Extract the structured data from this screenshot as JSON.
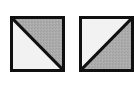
{
  "canvas": {
    "width": 134,
    "height": 86,
    "background_color": "#ffffff"
  },
  "figure": {
    "tile_count": 2,
    "border_color": "#101010",
    "border_width_px": 3,
    "light_fill_color": "#f2f2f2",
    "gray_fill_color": "#ababab",
    "gray_fill_texture": "dithered-speckle"
  },
  "tiles": [
    {
      "id": "tile-left",
      "label": "Square 1",
      "diagonal": "top-left-to-bottom-right",
      "light_half": "lower-left",
      "gray_half": "upper-right",
      "x": 10,
      "y": 16,
      "width": 55,
      "height": 56
    },
    {
      "id": "tile-right",
      "label": "Square 2",
      "diagonal": "bottom-left-to-top-right",
      "light_half": "upper-left",
      "gray_half": "lower-right",
      "x": 79,
      "y": 16,
      "width": 55,
      "height": 56,
      "clipped_edge": "right"
    }
  ]
}
